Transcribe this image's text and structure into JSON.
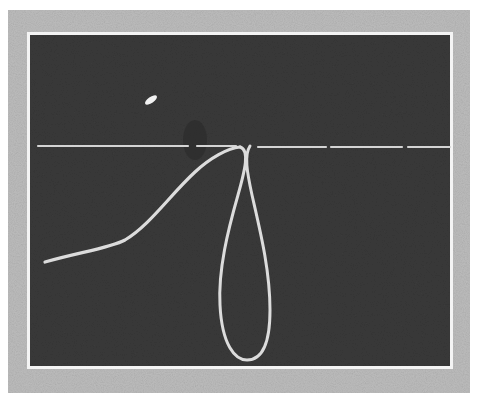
{
  "image": {
    "description": "Photograph of an oscilloscope screen showing a horizontal baseline trace with a looped waveform",
    "colors": {
      "background": "#ffffff",
      "outer_frame": "#bdbdbd",
      "inner_border": "#f4f4f4",
      "screen": "#3a3a3a",
      "trace": "#d9d9d9"
    }
  },
  "scene": {
    "frame": {
      "x": 8,
      "y": 10,
      "w": 462,
      "h": 383
    },
    "screen": {
      "x": 30,
      "y": 35,
      "w": 420,
      "h": 331
    },
    "baseline_y": 146,
    "blip": {
      "x": 150,
      "y": 100
    }
  }
}
